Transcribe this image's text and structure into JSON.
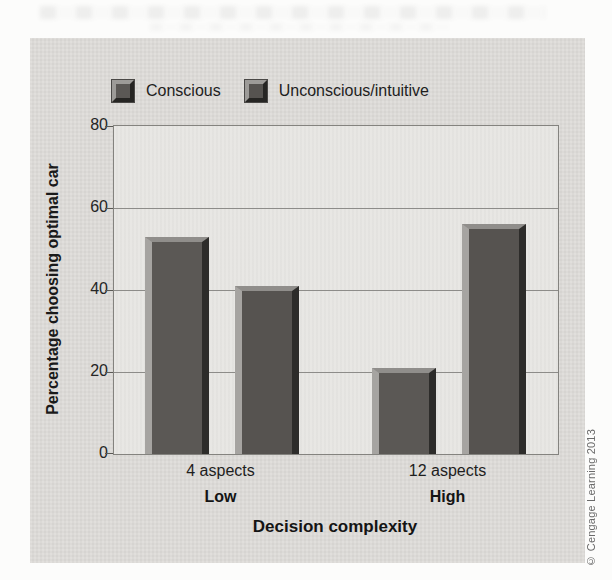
{
  "figure": {
    "copyright": "© Cengage Learning 2013"
  },
  "chart_data": {
    "type": "bar",
    "categories": [
      "4 aspects",
      "12 aspects"
    ],
    "category_sublabels": [
      "Low",
      "High"
    ],
    "series": [
      {
        "name": "Conscious",
        "values": [
          53,
          21
        ],
        "color": "#5b5855"
      },
      {
        "name": "Unconscious/intuitive",
        "values": [
          41,
          56
        ],
        "color": "#565350"
      }
    ],
    "title": "",
    "xlabel": "Decision complexity",
    "ylabel": "Percentage choosing optimal car",
    "ylim": [
      0,
      80
    ],
    "yticks": [
      0,
      20,
      40,
      60,
      80
    ],
    "grid": true,
    "legend_position": "top"
  },
  "colors": {
    "panel_background": "#dedcd9",
    "plot_background": "#e7e6e3",
    "gridline": "#8d8c89",
    "text": "#1e1e1e",
    "copyright_text": "#6a6a6a"
  }
}
